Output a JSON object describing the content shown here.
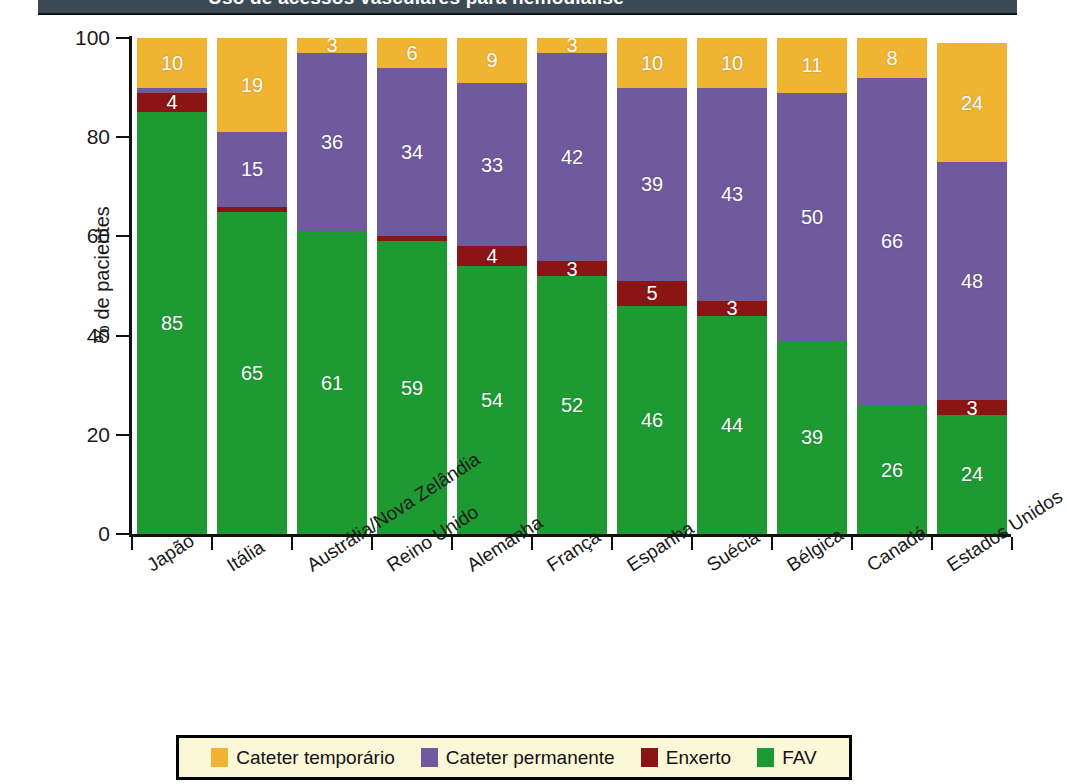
{
  "header": {
    "title_clipped": "Uso de acessos vasculares para hemodiálise",
    "band_color": "#3b4a55"
  },
  "colors": {
    "temporary_catheter": "#F0B432",
    "permanent_catheter": "#6F5A9E",
    "graft": "#8B1414",
    "fav": "#1E9A33",
    "legend_background": "#FBF8D8",
    "axis": "#111111"
  },
  "legend": {
    "items": [
      {
        "label": "Cateter temporário",
        "color": "#F0B432",
        "key": "temporary_catheter"
      },
      {
        "label": "Cateter permanente",
        "color": "#6F5A9E",
        "key": "permanent_catheter"
      },
      {
        "label": "Enxerto",
        "color": "#8B1414",
        "key": "graft"
      },
      {
        "label": "FAV",
        "color": "#1E9A33",
        "key": "fav"
      }
    ]
  },
  "chart_data": {
    "type": "bar",
    "stacked": true,
    "title": "",
    "xlabel": "",
    "ylabel": "% de pacientes",
    "ylim": [
      0,
      100
    ],
    "yticks": [
      0,
      20,
      40,
      60,
      80,
      100
    ],
    "grid": false,
    "legend_position": "bottom",
    "categories": [
      "Japão",
      "Itália",
      "Austrália/Nova Zelândia",
      "Reino Unido",
      "Alemanha",
      "França",
      "Espanha",
      "Suécia",
      "Bélgica",
      "Canadá",
      "Estados Unidos"
    ],
    "series": [
      {
        "name": "FAV",
        "color": "#1E9A33",
        "values": [
          85,
          65,
          61,
          59,
          54,
          52,
          46,
          44,
          39,
          26,
          24
        ]
      },
      {
        "name": "Enxerto",
        "color": "#8B1414",
        "values": [
          4,
          1,
          0,
          1,
          4,
          3,
          5,
          3,
          0,
          0,
          3
        ]
      },
      {
        "name": "Cateter permanente",
        "color": "#6F5A9E",
        "values": [
          1,
          15,
          36,
          34,
          33,
          42,
          39,
          43,
          50,
          66,
          48
        ]
      },
      {
        "name": "Cateter temporário",
        "color": "#F0B432",
        "values": [
          10,
          19,
          3,
          6,
          9,
          3,
          10,
          10,
          11,
          8,
          24
        ]
      }
    ]
  }
}
